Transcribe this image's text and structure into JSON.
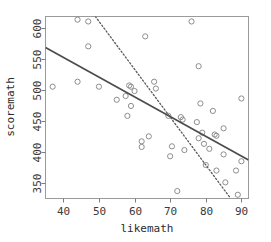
{
  "chart_data": {
    "type": "scatter",
    "title": "",
    "xlabel": "likemath",
    "ylabel": "scoremath",
    "xlim": [
      35.0,
      92.0
    ],
    "ylim": [
      325.0,
      618.0
    ],
    "grid": false,
    "legend": null,
    "xticks": [
      40,
      50,
      60,
      70,
      80,
      90
    ],
    "yticks": [
      350,
      400,
      450,
      500,
      550,
      600
    ],
    "point_marker": "open-circle",
    "points": [
      {
        "x": 37.0,
        "y": 505
      },
      {
        "x": 44.0,
        "y": 613
      },
      {
        "x": 44.0,
        "y": 513
      },
      {
        "x": 47.0,
        "y": 610
      },
      {
        "x": 47.0,
        "y": 570
      },
      {
        "x": 50.0,
        "y": 505
      },
      {
        "x": 55.0,
        "y": 484
      },
      {
        "x": 57.5,
        "y": 490
      },
      {
        "x": 58.0,
        "y": 458
      },
      {
        "x": 58.5,
        "y": 507
      },
      {
        "x": 59.0,
        "y": 505
      },
      {
        "x": 59.0,
        "y": 474
      },
      {
        "x": 60.0,
        "y": 498
      },
      {
        "x": 62.0,
        "y": 417
      },
      {
        "x": 62.0,
        "y": 408
      },
      {
        "x": 63.0,
        "y": 586
      },
      {
        "x": 64.0,
        "y": 425
      },
      {
        "x": 65.5,
        "y": 513
      },
      {
        "x": 66.0,
        "y": 502
      },
      {
        "x": 69.5,
        "y": 458
      },
      {
        "x": 70.0,
        "y": 393
      },
      {
        "x": 70.5,
        "y": 409
      },
      {
        "x": 72.0,
        "y": 337
      },
      {
        "x": 73.0,
        "y": 456
      },
      {
        "x": 73.5,
        "y": 452
      },
      {
        "x": 74.0,
        "y": 403
      },
      {
        "x": 76.0,
        "y": 610
      },
      {
        "x": 77.5,
        "y": 448
      },
      {
        "x": 78.0,
        "y": 538
      },
      {
        "x": 78.0,
        "y": 422
      },
      {
        "x": 78.5,
        "y": 478
      },
      {
        "x": 79.0,
        "y": 431
      },
      {
        "x": 79.5,
        "y": 413
      },
      {
        "x": 80.0,
        "y": 379
      },
      {
        "x": 81.0,
        "y": 405
      },
      {
        "x": 82.0,
        "y": 466
      },
      {
        "x": 82.5,
        "y": 428
      },
      {
        "x": 83.0,
        "y": 426
      },
      {
        "x": 83.0,
        "y": 370
      },
      {
        "x": 85.0,
        "y": 438
      },
      {
        "x": 85.0,
        "y": 396
      },
      {
        "x": 85.5,
        "y": 351
      },
      {
        "x": 88.5,
        "y": 370
      },
      {
        "x": 89.0,
        "y": 331
      },
      {
        "x": 90.0,
        "y": 486
      },
      {
        "x": 90.0,
        "y": 385
      }
    ],
    "lines": [
      {
        "name": "solid-fit-line",
        "style": "solid",
        "x1": 35.0,
        "y1": 568,
        "x2": 92.0,
        "y2": 387
      },
      {
        "name": "dotted-fit-line",
        "style": "dotted",
        "x1": 49.0,
        "y1": 618,
        "x2": 87.0,
        "y2": 325
      }
    ]
  },
  "axes": {
    "x": {
      "label": "likemath",
      "ticks": [
        "40",
        "50",
        "60",
        "70",
        "80",
        "90"
      ]
    },
    "y": {
      "label": "scoremath",
      "ticks": [
        "350",
        "400",
        "450",
        "500",
        "550",
        "600"
      ]
    }
  }
}
